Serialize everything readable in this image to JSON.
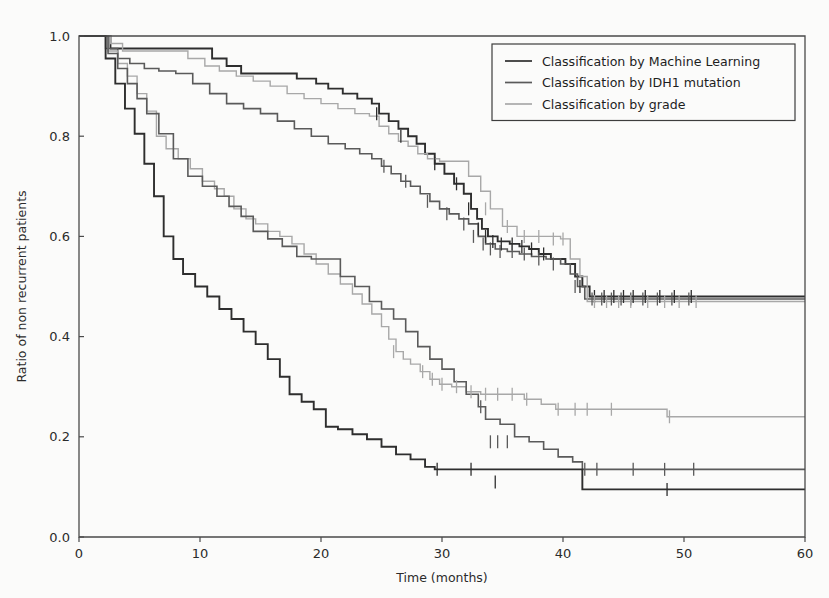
{
  "figure": {
    "background_color": "#fbfbfa",
    "axis_color": "#4a4a4a",
    "text_color": "#2b2b2b"
  },
  "legend": {
    "position": "upper-right",
    "border_color": "#3d3d3d",
    "entries": [
      {
        "label": "Classification by Machine Learning",
        "color": "#2e2e2e",
        "width": 1.9
      },
      {
        "label": "Classification by IDH1 mutation",
        "color": "#5a5a5a",
        "width": 1.6
      },
      {
        "label": "Classification by grade",
        "color": "#a8a8a8",
        "width": 1.4
      }
    ]
  },
  "chart_data": {
    "type": "line",
    "subtype": "kaplan-meier-step",
    "title": "",
    "xlabel": "Time (months)",
    "ylabel": "Ratio of non recurrent patients",
    "xlim": [
      0,
      60
    ],
    "ylim": [
      0.0,
      1.0
    ],
    "xticks": [
      0,
      10,
      20,
      30,
      40,
      50,
      60
    ],
    "xtick_labels": [
      "0",
      "10",
      "20",
      "30",
      "40",
      "50",
      "60"
    ],
    "yticks": [
      0.0,
      0.2,
      0.4,
      0.6,
      0.8,
      1.0
    ],
    "ytick_labels": [
      "0.0",
      "0.2",
      "0.4",
      "0.6",
      "0.8",
      "1.0"
    ],
    "grid": false,
    "series": [
      {
        "name": "Classification by Machine Learning — low risk",
        "group": "Machine Learning",
        "stratum": "low-risk",
        "color": "#2e2e2e",
        "width": 1.9,
        "final_value": 0.48,
        "x": [
          0,
          2.0,
          2.6,
          8.2,
          11.0,
          12.2,
          13.4,
          16.0,
          18.0,
          19.6,
          20.6,
          21.8,
          23.0,
          24.2,
          24.8,
          25.6,
          26.4,
          27.2,
          27.9,
          28.6,
          29.4,
          30.2,
          31.0,
          31.8,
          32.4,
          32.9,
          33.3,
          33.8,
          34.6,
          35.6,
          36.4,
          37.2,
          38.0,
          39.0,
          40.2,
          41.0,
          41.6,
          42.2,
          60
        ],
        "y": [
          1.0,
          1.0,
          0.975,
          0.975,
          0.955,
          0.94,
          0.925,
          0.925,
          0.915,
          0.905,
          0.895,
          0.885,
          0.875,
          0.865,
          0.845,
          0.83,
          0.815,
          0.8,
          0.785,
          0.765,
          0.745,
          0.725,
          0.705,
          0.685,
          0.655,
          0.635,
          0.615,
          0.6,
          0.59,
          0.585,
          0.58,
          0.575,
          0.565,
          0.555,
          0.545,
          0.52,
          0.5,
          0.48,
          0.48
        ],
        "censor_x": [
          24.6,
          26.6,
          29.4,
          31.2,
          32.2,
          33.0,
          33.6,
          34.2,
          34.9,
          35.8,
          36.6,
          37.4,
          38.4,
          41.4,
          42.6,
          43.4,
          44.2,
          45.0,
          45.8,
          46.8,
          48.0,
          49.2,
          50.6
        ],
        "censor_y": [
          0.845,
          0.8,
          0.745,
          0.705,
          0.655,
          0.615,
          0.6,
          0.59,
          0.585,
          0.585,
          0.58,
          0.575,
          0.565,
          0.5,
          0.48,
          0.48,
          0.48,
          0.48,
          0.48,
          0.48,
          0.48,
          0.48,
          0.48
        ]
      },
      {
        "name": "Classification by IDH1 mutation — mutated",
        "group": "IDH1 mutation",
        "stratum": "mutated",
        "color": "#5a5a5a",
        "width": 1.6,
        "final_value": 0.475,
        "x": [
          0,
          1.6,
          2.2,
          3.2,
          4.2,
          5.4,
          6.6,
          8.0,
          9.4,
          10.8,
          12.2,
          13.6,
          15.0,
          16.4,
          17.8,
          19.2,
          20.6,
          22.0,
          23.2,
          24.2,
          25.0,
          25.8,
          26.6,
          27.4,
          28.2,
          29.0,
          29.8,
          30.6,
          31.4,
          32.2,
          33.0,
          33.6,
          34.4,
          35.4,
          36.4,
          37.4,
          38.6,
          39.8,
          40.6,
          41.2,
          41.8,
          60
        ],
        "y": [
          1.0,
          1.0,
          0.975,
          0.955,
          0.945,
          0.935,
          0.93,
          0.925,
          0.905,
          0.885,
          0.865,
          0.855,
          0.845,
          0.83,
          0.815,
          0.8,
          0.785,
          0.775,
          0.765,
          0.755,
          0.74,
          0.725,
          0.71,
          0.7,
          0.685,
          0.67,
          0.655,
          0.645,
          0.635,
          0.625,
          0.6,
          0.585,
          0.575,
          0.57,
          0.565,
          0.56,
          0.555,
          0.545,
          0.525,
          0.5,
          0.475,
          0.475
        ],
        "censor_x": [
          25.2,
          27.0,
          28.8,
          30.4,
          31.8,
          32.6,
          33.4,
          34.0,
          34.8,
          35.8,
          36.8,
          38.0,
          39.2,
          41.0,
          42.4,
          43.2,
          44.0,
          44.8,
          45.6,
          46.6,
          47.8,
          49.0,
          50.4
        ],
        "censor_y": [
          0.74,
          0.71,
          0.67,
          0.645,
          0.625,
          0.6,
          0.585,
          0.575,
          0.57,
          0.57,
          0.565,
          0.555,
          0.545,
          0.5,
          0.475,
          0.475,
          0.475,
          0.475,
          0.475,
          0.475,
          0.475,
          0.475,
          0.475
        ]
      },
      {
        "name": "Classification by grade — low grade",
        "group": "grade",
        "stratum": "low-grade",
        "color": "#a8a8a8",
        "width": 1.4,
        "final_value": 0.47,
        "x": [
          0,
          1.8,
          2.6,
          3.6,
          6.6,
          9.0,
          10.4,
          11.6,
          13.0,
          14.4,
          15.8,
          17.2,
          18.6,
          20.0,
          21.4,
          22.8,
          24.0,
          24.8,
          25.6,
          26.4,
          27.2,
          28.0,
          28.8,
          29.8,
          31.0,
          32.2,
          33.2,
          34.0,
          35.0,
          36.2,
          37.4,
          38.6,
          39.8,
          40.6,
          41.4,
          42.0,
          60
        ],
        "y": [
          1.0,
          1.0,
          0.985,
          0.97,
          0.97,
          0.955,
          0.94,
          0.93,
          0.92,
          0.91,
          0.9,
          0.885,
          0.875,
          0.865,
          0.855,
          0.845,
          0.84,
          0.82,
          0.805,
          0.79,
          0.78,
          0.765,
          0.755,
          0.75,
          0.75,
          0.72,
          0.69,
          0.655,
          0.62,
          0.6,
          0.6,
          0.6,
          0.595,
          0.555,
          0.52,
          0.47,
          0.47
        ],
        "censor_x": [
          33.6,
          35.4,
          36.8,
          38.0,
          39.2,
          40.0,
          42.6,
          43.6,
          44.6,
          45.6,
          47.0,
          48.4,
          49.6,
          51.0
        ],
        "censor_y": [
          0.655,
          0.62,
          0.6,
          0.6,
          0.595,
          0.595,
          0.47,
          0.47,
          0.47,
          0.47,
          0.47,
          0.47,
          0.47,
          0.47
        ]
      },
      {
        "name": "Classification by grade — high grade",
        "group": "grade",
        "stratum": "high-grade",
        "color": "#a8a8a8",
        "width": 1.4,
        "final_value": 0.24,
        "x": [
          0,
          1.6,
          2.4,
          3.2,
          4.0,
          4.8,
          5.6,
          6.4,
          7.2,
          8.2,
          9.2,
          10.2,
          11.2,
          12.0,
          12.8,
          13.8,
          14.6,
          15.6,
          16.6,
          17.6,
          18.6,
          19.6,
          20.6,
          21.6,
          22.6,
          23.4,
          24.2,
          25.0,
          25.6,
          26.2,
          26.8,
          27.4,
          28.2,
          29.0,
          29.8,
          30.8,
          32.0,
          33.2,
          34.4,
          35.6,
          36.8,
          38.2,
          39.4,
          48.6,
          60
        ],
        "y": [
          1.0,
          1.0,
          0.97,
          0.945,
          0.92,
          0.885,
          0.85,
          0.8,
          0.775,
          0.755,
          0.735,
          0.71,
          0.695,
          0.68,
          0.655,
          0.635,
          0.625,
          0.61,
          0.6,
          0.585,
          0.565,
          0.545,
          0.525,
          0.505,
          0.485,
          0.465,
          0.445,
          0.42,
          0.395,
          0.37,
          0.355,
          0.345,
          0.33,
          0.315,
          0.305,
          0.3,
          0.29,
          0.285,
          0.285,
          0.285,
          0.275,
          0.265,
          0.255,
          0.24,
          0.24
        ],
        "censor_x": [
          26.0,
          28.4,
          29.2,
          30.0,
          31.2,
          32.4,
          33.6,
          34.6,
          35.8,
          37.0,
          39.6,
          41.0,
          42.0,
          44.0,
          48.8
        ],
        "censor_y": [
          0.37,
          0.33,
          0.315,
          0.305,
          0.3,
          0.29,
          0.285,
          0.285,
          0.285,
          0.275,
          0.255,
          0.255,
          0.255,
          0.255,
          0.24
        ]
      },
      {
        "name": "Classification by IDH1 mutation — wild type",
        "group": "IDH1 mutation",
        "stratum": "wild-type",
        "color": "#5a5a5a",
        "width": 1.6,
        "final_value": 0.135,
        "x": [
          0,
          1.6,
          2.4,
          3.2,
          4.0,
          4.8,
          5.6,
          6.6,
          7.8,
          9.0,
          10.2,
          11.4,
          12.4,
          13.4,
          14.4,
          15.6,
          16.8,
          18.0,
          19.2,
          20.4,
          21.6,
          22.8,
          24.0,
          25.0,
          26.0,
          27.0,
          28.0,
          29.0,
          30.0,
          31.0,
          32.0,
          33.0,
          33.6,
          34.8,
          36.0,
          37.2,
          38.4,
          39.6,
          40.8,
          41.6,
          60
        ],
        "y": [
          1.0,
          1.0,
          0.965,
          0.935,
          0.905,
          0.875,
          0.845,
          0.805,
          0.755,
          0.72,
          0.7,
          0.68,
          0.66,
          0.64,
          0.61,
          0.595,
          0.58,
          0.56,
          0.555,
          0.555,
          0.52,
          0.5,
          0.47,
          0.455,
          0.435,
          0.41,
          0.38,
          0.355,
          0.335,
          0.31,
          0.285,
          0.26,
          0.235,
          0.225,
          0.2,
          0.19,
          0.175,
          0.16,
          0.15,
          0.135,
          0.135
        ],
        "censor_x": [
          33.2,
          34.0,
          34.6,
          35.4,
          41.8,
          42.8,
          45.8,
          48.4,
          50.8
        ],
        "censor_y": [
          0.26,
          0.19,
          0.19,
          0.19,
          0.135,
          0.135,
          0.135,
          0.135,
          0.135
        ]
      },
      {
        "name": "Classification by Machine Learning — high risk",
        "group": "Machine Learning",
        "stratum": "high-risk",
        "color": "#2e2e2e",
        "width": 1.9,
        "final_value": 0.095,
        "x": [
          0,
          1.4,
          2.2,
          3.0,
          3.8,
          4.6,
          5.4,
          6.2,
          7.0,
          7.8,
          8.6,
          9.6,
          10.6,
          11.6,
          12.6,
          13.6,
          14.6,
          15.6,
          16.6,
          17.4,
          18.4,
          19.4,
          20.4,
          21.4,
          22.6,
          23.8,
          25.0,
          26.2,
          27.4,
          28.6,
          29.4,
          41.6,
          60
        ],
        "y": [
          1.0,
          1.0,
          0.955,
          0.905,
          0.855,
          0.805,
          0.745,
          0.68,
          0.6,
          0.555,
          0.525,
          0.5,
          0.48,
          0.455,
          0.435,
          0.41,
          0.385,
          0.355,
          0.32,
          0.285,
          0.27,
          0.255,
          0.22,
          0.215,
          0.205,
          0.195,
          0.18,
          0.165,
          0.155,
          0.14,
          0.135,
          0.095,
          0.095
        ],
        "censor_x": [
          29.6,
          32.4,
          34.4,
          48.6
        ],
        "censor_y": [
          0.135,
          0.135,
          0.11,
          0.095
        ]
      }
    ]
  }
}
